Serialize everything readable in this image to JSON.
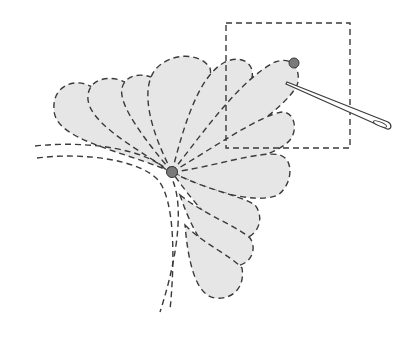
{
  "diagram": {
    "colors": {
      "petal_fill": "#e6e6e6",
      "stroke": "#3a3a3a",
      "knot": "#7a7a7a",
      "background": "#ffffff"
    },
    "elements": {
      "petals_upper": 6,
      "petals_lower": 4,
      "knots": 2,
      "needle": true,
      "detail_box": true,
      "spine_lines": 2
    }
  }
}
